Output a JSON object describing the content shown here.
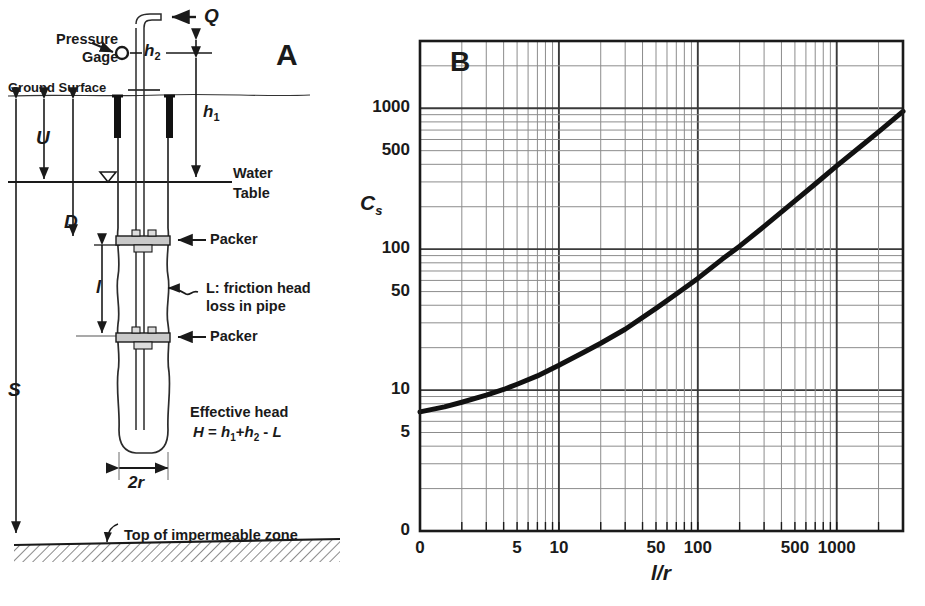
{
  "figure": {
    "panel_a": {
      "tag": "A",
      "labels": {
        "pressure_gage_line1": "Pressure",
        "pressure_gage_line2": "Gage",
        "ground_surface": "Ground Surface",
        "water_line1": "Water",
        "water_line2": "Table",
        "packer_upper": "Packer",
        "packer_lower": "Packer",
        "friction_line1": "L: friction head",
        "friction_line2": "loss in pipe",
        "effective_head_line1": "Effective head",
        "effective_head_line2": "H = h1+h2 - L",
        "impermeable": "Top of impermeable zone",
        "q": "Q",
        "h1": "h1",
        "h2": "h2",
        "u": "U",
        "d": "D",
        "l": "l",
        "s": "S",
        "two_r": "2r"
      }
    },
    "panel_b": {
      "tag": "B"
    }
  },
  "chart_data": {
    "type": "line",
    "title": "",
    "xlabel": "l/r",
    "ylabel": "Cs",
    "xscale": "log",
    "yscale": "log",
    "xlim": [
      1,
      3000
    ],
    "ylim": [
      1,
      3000
    ],
    "grid": "log-log minor grid on",
    "legend": "none",
    "xticks": [
      {
        "value": 1,
        "label": "0"
      },
      {
        "value": 5,
        "label": "5"
      },
      {
        "value": 10,
        "label": "10"
      },
      {
        "value": 50,
        "label": "50"
      },
      {
        "value": 100,
        "label": "100"
      },
      {
        "value": 500,
        "label": "500"
      },
      {
        "value": 1000,
        "label": "1000"
      }
    ],
    "yticks": [
      {
        "value": 1,
        "label": "0"
      },
      {
        "value": 5,
        "label": "5"
      },
      {
        "value": 10,
        "label": "10"
      },
      {
        "value": 50,
        "label": "50"
      },
      {
        "value": 100,
        "label": "100"
      },
      {
        "value": 500,
        "label": "500"
      },
      {
        "value": 1000,
        "label": "1000"
      }
    ],
    "series": [
      {
        "name": "Cs vs l/r",
        "x": [
          1.0,
          1.5,
          2.0,
          3.0,
          4.0,
          5.0,
          7.0,
          10.0,
          15.0,
          20.0,
          30.0,
          50.0,
          70.0,
          100.0,
          150.0,
          200.0,
          300.0,
          500.0,
          700.0,
          1000.0,
          1500.0,
          2000.0,
          3000.0
        ],
        "y": [
          7.0,
          7.6,
          8.2,
          9.2,
          10.1,
          11.0,
          12.6,
          15.0,
          18.5,
          21.5,
          27.0,
          38.0,
          48.0,
          62.0,
          85.0,
          105.0,
          145.0,
          220.0,
          290.0,
          390.0,
          540.0,
          680.0,
          950.0
        ]
      }
    ]
  }
}
